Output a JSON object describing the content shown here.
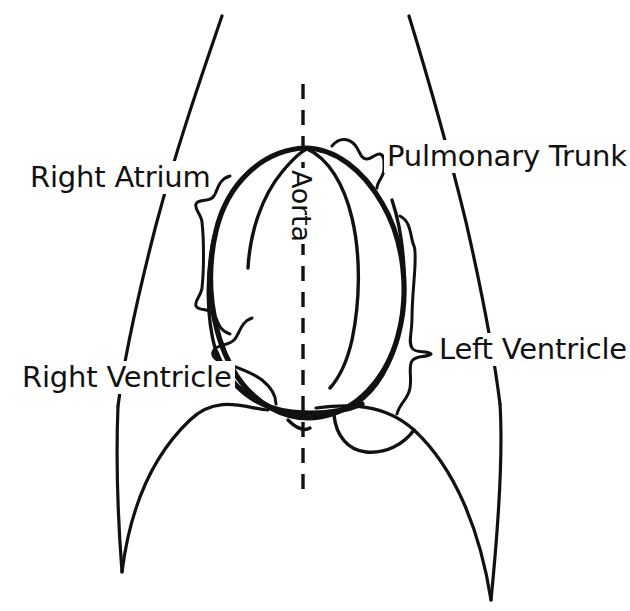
{
  "figure": {
    "kind": "anatomical-line-diagram",
    "width": 630,
    "height": 611,
    "background_color": "#ffffff",
    "ink_color": "#111111"
  },
  "labels": {
    "right_atrium": "Right Atrium",
    "pulmonary_trunk": "Pulmonary Trunk",
    "left_ventricle": "Left Ventricle",
    "right_ventricle": "Right Ventricle",
    "aorta": "Aorta"
  },
  "annotations": {
    "midline": "vertical dashed midline",
    "braces": [
      "right-atrium-brace",
      "pulmonary-trunk-brace",
      "left-ventricle-brace",
      "right-ventricle-brace"
    ]
  }
}
